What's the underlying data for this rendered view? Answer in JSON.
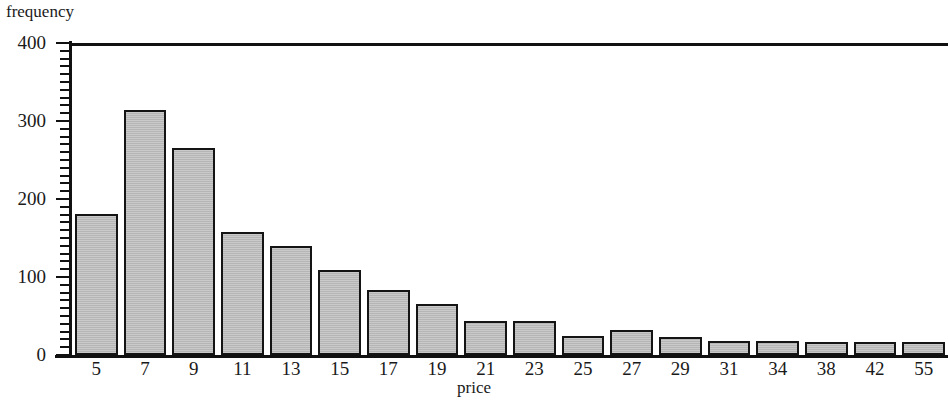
{
  "chart_data": {
    "type": "bar",
    "title": "",
    "xlabel": "price",
    "ylabel": "frequency",
    "categories": [
      "5",
      "7",
      "9",
      "11",
      "13",
      "15",
      "17",
      "19",
      "21",
      "23",
      "25",
      "27",
      "29",
      "31",
      "34",
      "38",
      "42",
      "55"
    ],
    "values": [
      181,
      314,
      266,
      158,
      140,
      109,
      83,
      65,
      43,
      43,
      24,
      32,
      23,
      18,
      18,
      17,
      17,
      17
    ],
    "ylim": [
      0,
      400
    ],
    "xlim_note": "categorical bins",
    "y_major_ticks": [
      0,
      100,
      200,
      300,
      400
    ],
    "y_tick_labels": [
      "0",
      "100",
      "200",
      "300",
      "400"
    ],
    "y_minor_tick_step": 10,
    "grid": false,
    "legend": null,
    "bar_fill_color": "#b5b5b5",
    "bar_edge_color": "#141414",
    "axis_color": "#111111",
    "background_color": "#ffffff"
  }
}
